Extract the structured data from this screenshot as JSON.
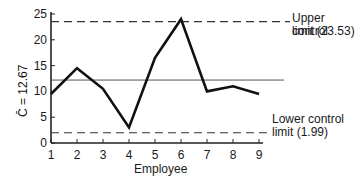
{
  "chart_data": {
    "type": "line",
    "title": "",
    "xlabel": "Employee",
    "ylabel": "C̄ = 12.67",
    "x": [
      1,
      2,
      3,
      4,
      5,
      6,
      7,
      8,
      9
    ],
    "series": [
      {
        "name": "Defects per employee",
        "values": [
          9.5,
          14.5,
          10.5,
          3,
          16.5,
          24,
          10,
          11,
          9.5
        ]
      }
    ],
    "ylim": [
      0,
      25
    ],
    "yticks": [
      0,
      5,
      10,
      15,
      20,
      25
    ],
    "xticks": [
      1,
      2,
      3,
      4,
      5,
      6,
      7,
      8,
      9
    ],
    "center_line": 12.67,
    "upper_control_limit": 23.53,
    "lower_control_limit": 1.99,
    "annotations": [
      "Upper control limit (23.53)",
      "Lower control limit (1.99)"
    ],
    "grid": false
  },
  "labels": {
    "ucl_line1": "Upper control",
    "ucl_line2": "limit (23.53)",
    "lcl_line1": "Lower control",
    "lcl_line2": "limit (1.99)",
    "xlabel": "Employee",
    "ylabel": "C̄ = 12.67"
  }
}
